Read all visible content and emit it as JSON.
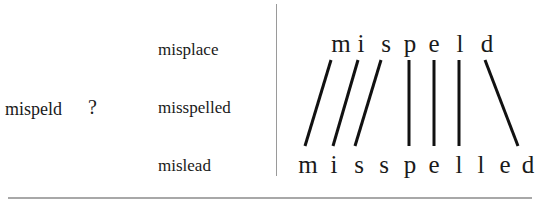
{
  "left": {
    "misspelled_word": "mispeld",
    "question_mark": "?",
    "candidates": [
      "misplace",
      "misspelled",
      "mislead"
    ]
  },
  "alignment": {
    "source_word": "mispeld",
    "target_word": "misspelled",
    "source_letters": [
      "m",
      "i",
      "s",
      "p",
      "e",
      "l",
      "d"
    ],
    "target_letters": [
      "m",
      "i",
      "s",
      "s",
      "p",
      "e",
      "l",
      "l",
      "e",
      "d"
    ],
    "links": [
      {
        "from": 0,
        "to": 0
      },
      {
        "from": 1,
        "to": 1
      },
      {
        "from": 2,
        "to": 2
      },
      {
        "from": 3,
        "to": 4
      },
      {
        "from": 4,
        "to": 5
      },
      {
        "from": 5,
        "to": 6
      },
      {
        "from": 6,
        "to": 9
      }
    ],
    "line_color": "#111111"
  }
}
